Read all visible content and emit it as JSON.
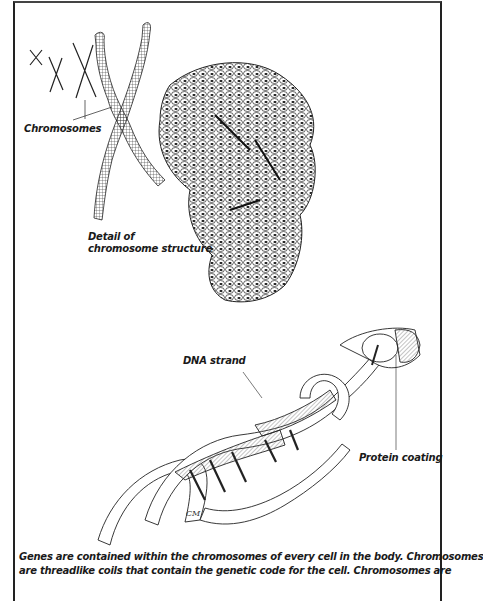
{
  "figure": {
    "labels": {
      "chromosomes": "Chromosomes",
      "detail_line1": "Detail of",
      "detail_line2": "chromosome structure",
      "dna_strand": "DNA strand",
      "protein_coating": "Protein coating"
    },
    "signature": "CM",
    "caption_lines": [
      "Genes are contained within the chromosomes of every cell in the body. Chromosomes",
      "are threadlike coils that contain the genetic code for the cell. Chromosomes are"
    ]
  }
}
